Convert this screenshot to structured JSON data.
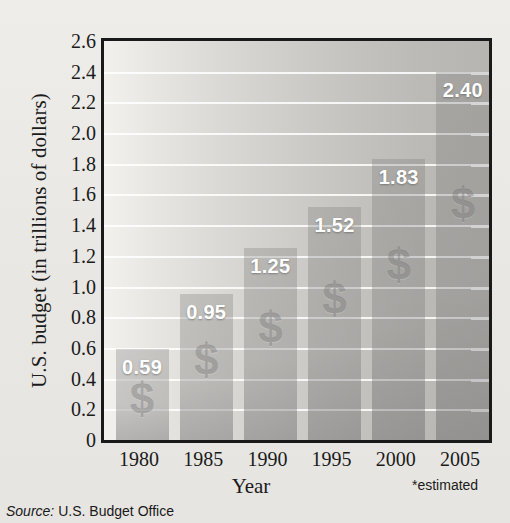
{
  "chart_data": {
    "type": "bar",
    "title": "",
    "categories": [
      "1980",
      "1985",
      "1990",
      "1995",
      "2000",
      "2005"
    ],
    "values": [
      0.59,
      0.95,
      1.25,
      1.52,
      1.83,
      2.4
    ],
    "value_labels": [
      "0.59",
      "0.95",
      "1.25",
      "1.52",
      "1.83",
      "2.40"
    ],
    "xlabel": "Year",
    "ylabel": "U.S. budget (in trillions of dollars)",
    "ylim": [
      0,
      2.6
    ],
    "ytick_labels": [
      "0",
      "0.2",
      "0.4",
      "0.6",
      "0.8",
      "1.0",
      "1.2",
      "1.4",
      "1.6",
      "1.8",
      "2.0",
      "2.2",
      "2.4",
      "2.6"
    ],
    "ytick_values": [
      0,
      0.2,
      0.4,
      0.6,
      0.8,
      1.0,
      1.2,
      1.4,
      1.6,
      1.8,
      2.0,
      2.2,
      2.4,
      2.6
    ],
    "grid": true,
    "legend": "none",
    "bar_watermark_glyph": "$",
    "footnote": "*estimated",
    "source_label": "Source:",
    "source_text": "U.S. Budget Office",
    "colors": {
      "bar": "#9c9a96",
      "value_label": "#ffffff",
      "gridline": "#ffffff",
      "frame": "#1a1a1a",
      "text": "#1b1b1b",
      "plot_background_light": "#f2f1ee",
      "plot_background_dark": "#b7b5b1",
      "page_background": "#eceae6"
    }
  }
}
